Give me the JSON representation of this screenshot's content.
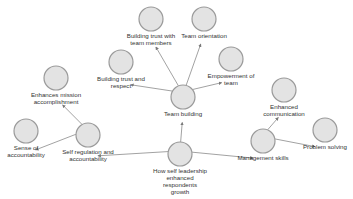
{
  "diagram": {
    "type": "concept-map",
    "node_fill": "#e3e3e3",
    "node_stroke": "#9a9a9a",
    "edge_color": "#7a7a7a",
    "nodes": [
      {
        "id": "root",
        "label": [
          "How self leadership",
          "enhanced",
          "respondents",
          "growth"
        ],
        "x": 180,
        "y": 154
      },
      {
        "id": "team-building",
        "label": [
          "Team building"
        ],
        "x": 183,
        "y": 97
      },
      {
        "id": "trust-members",
        "label": [
          "Building trust with",
          "team members"
        ],
        "x": 151,
        "y": 19
      },
      {
        "id": "team-orientation",
        "label": [
          "Team orientation"
        ],
        "x": 204,
        "y": 19
      },
      {
        "id": "trust-respect",
        "label": [
          "Building trust and",
          "respect"
        ],
        "x": 121,
        "y": 62
      },
      {
        "id": "empowerment",
        "label": [
          "Empowerment of",
          "team"
        ],
        "x": 231,
        "y": 59
      },
      {
        "id": "self-regulation",
        "label": [
          "Self regulation and",
          "accountability"
        ],
        "x": 88,
        "y": 135
      },
      {
        "id": "mission",
        "label": [
          "Enhances mission",
          "accomplishment"
        ],
        "x": 56,
        "y": 78
      },
      {
        "id": "sense-accountability",
        "label": [
          "Sense of",
          "accountability"
        ],
        "x": 26,
        "y": 131
      },
      {
        "id": "management",
        "label": [
          "Management skills"
        ],
        "x": 263,
        "y": 141
      },
      {
        "id": "communication",
        "label": [
          "Enhanced",
          "communication"
        ],
        "x": 284,
        "y": 90
      },
      {
        "id": "problem-solving",
        "label": [
          "Problem solving"
        ],
        "x": 325,
        "y": 130
      }
    ],
    "edges": [
      {
        "from": "root",
        "to": "team-building"
      },
      {
        "from": "root",
        "to": "self-regulation"
      },
      {
        "from": "root",
        "to": "management"
      },
      {
        "from": "team-building",
        "to": "trust-members"
      },
      {
        "from": "team-building",
        "to": "team-orientation"
      },
      {
        "from": "team-building",
        "to": "trust-respect"
      },
      {
        "from": "team-building",
        "to": "empowerment"
      },
      {
        "from": "self-regulation",
        "to": "mission"
      },
      {
        "from": "self-regulation",
        "to": "sense-accountability"
      },
      {
        "from": "management",
        "to": "communication"
      },
      {
        "from": "management",
        "to": "problem-solving"
      }
    ]
  }
}
